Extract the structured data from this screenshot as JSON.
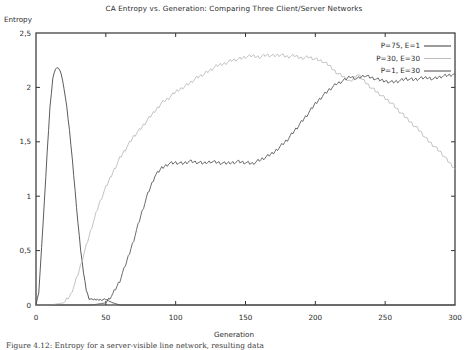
{
  "figure": {
    "title": "CA Entropy vs. Generation: Comparing Three Client/Server Networks",
    "ylabel": "Entropy",
    "xlabel": "Generation",
    "caption": "Figure 4.12: Entropy for a server-visible line network, resulting data"
  },
  "chart_data": {
    "type": "line",
    "title": "CA Entropy vs. Generation: Comparing Three Client/Server Networks",
    "xlabel": "Generation",
    "ylabel": "Entropy",
    "xlim": [
      0,
      300
    ],
    "ylim": [
      0,
      2.5
    ],
    "xticks": [
      "0",
      "50",
      "100",
      "150",
      "200",
      "250",
      "300"
    ],
    "xtick_values": [
      0,
      50,
      100,
      150,
      200,
      250,
      300
    ],
    "yticks": [
      "0",
      "0,5",
      "1",
      "1,5",
      "2",
      "2,5"
    ],
    "ytick_values": [
      0,
      0.5,
      1,
      1.5,
      2,
      2.5
    ],
    "grid": false,
    "legend_position": "top-right-inside",
    "series": [
      {
        "name": "P=75, E=1",
        "color": "#4a4a4a",
        "x": [
          0,
          2,
          4,
          6,
          8,
          10,
          12,
          14,
          16,
          18,
          20,
          22,
          24,
          26,
          28,
          30,
          32,
          34,
          36,
          38,
          40,
          42,
          44,
          46,
          48,
          50,
          55,
          60,
          80,
          100,
          150,
          200,
          250,
          300
        ],
        "y": [
          0.0,
          0.12,
          0.52,
          0.95,
          1.4,
          1.82,
          2.08,
          2.17,
          2.18,
          2.13,
          2.0,
          1.82,
          1.6,
          1.34,
          1.05,
          0.76,
          0.5,
          0.3,
          0.14,
          0.06,
          0.05,
          0.05,
          0.05,
          0.05,
          0.05,
          0.05,
          0.02,
          0.0,
          0.0,
          0.0,
          0.0,
          0.0,
          0.0,
          0.0
        ]
      },
      {
        "name": "P=30, E=30",
        "color": "#b4b4b4",
        "x": [
          0,
          10,
          20,
          25,
          30,
          35,
          40,
          45,
          50,
          55,
          60,
          65,
          70,
          75,
          80,
          85,
          90,
          95,
          100,
          105,
          110,
          115,
          120,
          125,
          130,
          135,
          140,
          145,
          150,
          155,
          160,
          165,
          170,
          175,
          180,
          185,
          190,
          195,
          200,
          205,
          210,
          215,
          220,
          225,
          230,
          235,
          240,
          245,
          250,
          255,
          260,
          265,
          270,
          275,
          280,
          285,
          290,
          295,
          300
        ],
        "y": [
          0.0,
          0.0,
          0.02,
          0.1,
          0.28,
          0.5,
          0.72,
          0.92,
          1.08,
          1.22,
          1.35,
          1.45,
          1.55,
          1.62,
          1.7,
          1.78,
          1.86,
          1.9,
          1.96,
          2.0,
          2.04,
          2.09,
          2.12,
          2.16,
          2.2,
          2.22,
          2.25,
          2.26,
          2.28,
          2.29,
          2.28,
          2.3,
          2.29,
          2.3,
          2.28,
          2.29,
          2.27,
          2.28,
          2.26,
          2.24,
          2.2,
          2.14,
          2.1,
          2.05,
          2.12,
          2.06,
          2.0,
          1.95,
          1.9,
          1.85,
          1.78,
          1.72,
          1.66,
          1.6,
          1.52,
          1.46,
          1.4,
          1.32,
          1.25
        ]
      },
      {
        "name": "P=1, E=30",
        "color": "#5a5a5a",
        "x": [
          0,
          20,
          40,
          50,
          55,
          60,
          65,
          70,
          75,
          80,
          85,
          90,
          95,
          100,
          105,
          110,
          115,
          120,
          125,
          130,
          135,
          140,
          145,
          150,
          155,
          160,
          165,
          170,
          175,
          180,
          185,
          190,
          195,
          200,
          205,
          210,
          215,
          220,
          225,
          230,
          235,
          240,
          245,
          250,
          255,
          260,
          265,
          270,
          275,
          280,
          285,
          290,
          295,
          300
        ],
        "y": [
          0.0,
          0.0,
          0.0,
          0.02,
          0.1,
          0.22,
          0.4,
          0.6,
          0.82,
          1.02,
          1.18,
          1.26,
          1.3,
          1.31,
          1.3,
          1.32,
          1.31,
          1.3,
          1.32,
          1.31,
          1.3,
          1.31,
          1.32,
          1.31,
          1.3,
          1.33,
          1.36,
          1.4,
          1.46,
          1.52,
          1.6,
          1.68,
          1.76,
          1.85,
          1.92,
          1.98,
          2.03,
          2.06,
          2.1,
          2.08,
          2.11,
          2.09,
          2.07,
          2.06,
          2.05,
          2.06,
          2.08,
          2.07,
          2.08,
          2.09,
          2.08,
          2.1,
          2.11,
          2.12
        ]
      }
    ]
  },
  "legend": {
    "items": [
      {
        "label": "P=75, E=1",
        "color": "#4a4a4a"
      },
      {
        "label": "P=30, E=30",
        "color": "#b4b4b4"
      },
      {
        "label": "P=1, E=30",
        "color": "#5a5a5a"
      }
    ]
  }
}
